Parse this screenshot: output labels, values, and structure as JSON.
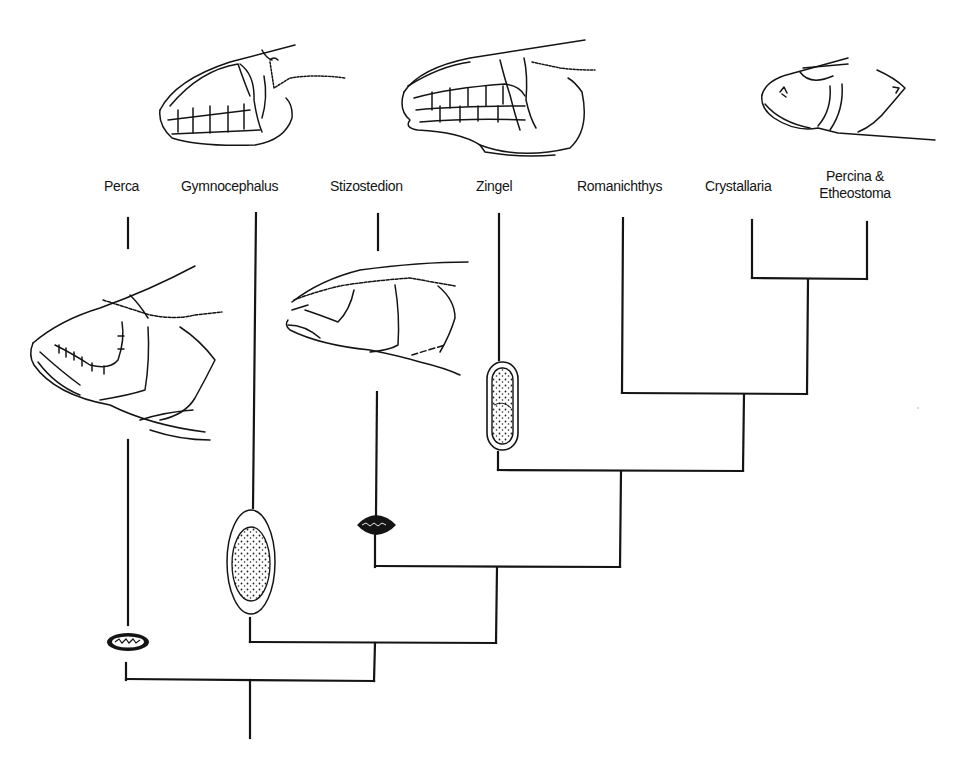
{
  "figure": {
    "type": "cladogram"
  },
  "taxa": [
    {
      "id": "perca",
      "label": "Perca",
      "x": 125,
      "y": 178
    },
    {
      "id": "gymnocephalus",
      "label": "Gymnocephalus",
      "x": 242,
      "y": 178
    },
    {
      "id": "stizostedion",
      "label": "Stizostedion",
      "x": 372,
      "y": 178
    },
    {
      "id": "zingel",
      "label": "Zingel",
      "x": 496,
      "y": 178
    },
    {
      "id": "romanichthys",
      "label": "Romanichthys",
      "x": 629,
      "y": 178
    },
    {
      "id": "crystallaria",
      "label": "Crystallaria",
      "x": 753,
      "y": 178
    },
    {
      "id": "percina_etheostoma",
      "label_line1": "Percina &",
      "label_line2": "Etheostoma",
      "x": 867,
      "y": 168
    }
  ],
  "tree": {
    "tips": {
      "perca": 128,
      "gymnocephalus": 253,
      "stizostedion": 378,
      "zingel": 498,
      "romanichthys": 623,
      "crystallaria": 752,
      "percina_etheostoma": 867
    },
    "nodes": [
      {
        "joins": [
          "crystallaria",
          "percina_etheostoma"
        ],
        "y": 278,
        "x": 808
      },
      {
        "joins": [
          "romanichthys",
          "crystallaria+percina_etheostoma"
        ],
        "y": 393,
        "x": 744
      },
      {
        "joins": [
          "zingel",
          "romanichthys+"
        ],
        "y": 470,
        "x": 620
      },
      {
        "joins": [
          "stizostedion",
          "zingel+"
        ],
        "y": 567,
        "x": 497
      },
      {
        "joins": [
          "gymnocephalus",
          "stizostedion+"
        ],
        "y": 642,
        "x": 375
      },
      {
        "joins": [
          "perca",
          "gymnocephalus+"
        ],
        "y": 680,
        "x": 250
      }
    ],
    "root": {
      "x": 250,
      "y_top": 680,
      "y_bottom": 738
    }
  },
  "head_drawings": [
    {
      "id": "head-gymnocephalus",
      "taxon": "Gymnocephalus",
      "position": "top"
    },
    {
      "id": "head-zingel",
      "taxon": "Zingel",
      "position": "top"
    },
    {
      "id": "head-percina",
      "taxon": "Percina & Etheostoma",
      "position": "top"
    },
    {
      "id": "head-perca",
      "taxon": "Perca",
      "position": "lower-left"
    },
    {
      "id": "head-stizostedion",
      "taxon": "Stizostedion",
      "position": "middle"
    }
  ],
  "egg_drawings": [
    {
      "id": "egg-perca",
      "taxon": "Perca",
      "shape": "small flattened oval"
    },
    {
      "id": "egg-gymnocephalus",
      "taxon": "Gymnocephalus",
      "shape": "large stippled ellipse"
    },
    {
      "id": "egg-stizostedion",
      "taxon": "Stizostedion",
      "shape": "small dark diamond"
    },
    {
      "id": "egg-zingel",
      "taxon": "Zingel",
      "shape": "elongate stippled capsule"
    }
  ],
  "colors": {
    "line": "#141414",
    "background": "#ffffff"
  }
}
